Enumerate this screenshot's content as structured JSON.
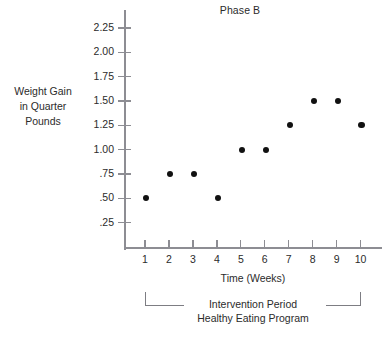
{
  "chart_data": {
    "type": "scatter",
    "title": "Phase B",
    "xlabel": "Time (Weeks)",
    "ylabel": "Weight Gain in Quarter Pounds",
    "ylabel_lines": [
      "Weight Gain",
      "in Quarter",
      "Pounds"
    ],
    "x": [
      1,
      2,
      3,
      4,
      5,
      6,
      7,
      8,
      9,
      10
    ],
    "values": [
      0.5,
      0.75,
      0.75,
      0.5,
      1.0,
      1.0,
      1.25,
      1.5,
      1.5,
      1.25
    ],
    "categories": [
      "1",
      "2",
      "3",
      "4",
      "5",
      "6",
      "7",
      "8",
      "9",
      "10"
    ],
    "xtick_labels": [
      "1",
      "2",
      "3",
      "4",
      "5",
      "6",
      "7",
      "8",
      "9",
      "10"
    ],
    "ytick_labels": [
      "2.25",
      "2.00",
      "1.75",
      "1.50",
      "1.25",
      "1.00",
      ".75",
      ".50",
      ".25"
    ],
    "ytick_values": [
      2.25,
      2.0,
      1.75,
      1.5,
      1.25,
      1.0,
      0.75,
      0.5,
      0.25
    ],
    "ylim": [
      0,
      2.375
    ],
    "xlim": [
      0.3,
      10.7
    ],
    "grid": false,
    "legend": null,
    "marker_color": "#111111",
    "axis_color": "#8d8d93",
    "text_color": "#2b2b2b",
    "background_color": "#ffffff",
    "annotations": [
      {
        "name": "intervention-bracket",
        "lines": [
          "Intervention Period",
          "Healthy Eating Program"
        ],
        "span_start_week": 1,
        "span_end_week": 10
      }
    ]
  },
  "annotation": {
    "line1": "Intervention Period",
    "line2": "Healthy Eating Program"
  }
}
